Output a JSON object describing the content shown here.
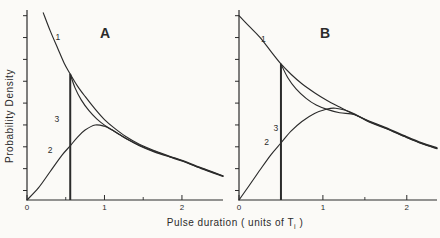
{
  "figure": {
    "xlabel_before": "Pulse duration ( units of T",
    "xlabel_sub": "i",
    "xlabel_after": " )",
    "ylabel": "Probability Density",
    "ink_color": "#2b2b2b",
    "paper_color": "#fbfaf7"
  },
  "chart_data": {
    "type": "line",
    "xlabel": "Pulse duration ( units of Ti )",
    "ylabel": "Probability Density",
    "legend": "none",
    "grid": false,
    "panels": [
      {
        "label": "A",
        "xlim": [
          0,
          2.53
        ],
        "ylim_norm": [
          0,
          1
        ],
        "x_major_ticks": [
          {
            "v": 0,
            "label": "0"
          },
          {
            "v": 1,
            "label": "1"
          },
          {
            "v": 2,
            "label": "2"
          }
        ],
        "x_minor_ticks": [
          0.5,
          1.5
        ],
        "y_ticks_norm": [
          0.05,
          0.165,
          0.28,
          0.395,
          0.51,
          0.625,
          0.74,
          0.855,
          0.97
        ],
        "curves": [
          {
            "name": "1",
            "label_at": [
              0.4,
              0.84
            ],
            "points": [
              [
                0.21,
                0.985
              ],
              [
                0.3,
                0.89
              ],
              [
                0.4,
                0.795
              ],
              [
                0.48,
                0.72
              ],
              [
                0.558,
                0.663
              ],
              [
                0.65,
                0.601
              ],
              [
                0.75,
                0.545
              ],
              [
                0.88,
                0.478
              ],
              [
                1.0,
                0.423
              ],
              [
                1.12,
                0.381
              ],
              [
                1.27,
                0.336
              ],
              [
                1.45,
                0.294
              ],
              [
                1.65,
                0.259
              ],
              [
                1.85,
                0.229
              ],
              [
                2.0,
                0.209
              ],
              [
                2.25,
                0.169
              ],
              [
                2.53,
                0.128
              ]
            ]
          },
          {
            "name": "2",
            "label_at": [
              0.3,
              0.25
            ],
            "points": [
              [
                0,
                0
              ],
              [
                0.15,
                0.065
              ],
              [
                0.3,
                0.15
              ],
              [
                0.45,
                0.235
              ],
              [
                0.558,
                0.285
              ],
              [
                0.65,
                0.33
              ],
              [
                0.75,
                0.368
              ],
              [
                0.88,
                0.395
              ],
              [
                1.0,
                0.388
              ],
              [
                1.1,
                0.368
              ],
              [
                1.2,
                0.343
              ],
              [
                1.3,
                0.318
              ],
              [
                1.45,
                0.288
              ],
              [
                1.65,
                0.255
              ],
              [
                1.85,
                0.227
              ],
              [
                2.0,
                0.207
              ],
              [
                2.25,
                0.167
              ],
              [
                2.53,
                0.126
              ]
            ]
          },
          {
            "name": "3",
            "label_at": [
              0.385,
              0.41
            ],
            "drop_line": {
              "x": 0.558,
              "top": 0.663
            },
            "points": [
              [
                0.558,
                0.663
              ],
              [
                0.62,
                0.59
              ],
              [
                0.7,
                0.527
              ],
              [
                0.8,
                0.47
              ],
              [
                0.9,
                0.427
              ],
              [
                1.0,
                0.394
              ],
              [
                1.12,
                0.363
              ],
              [
                1.27,
                0.326
              ],
              [
                1.45,
                0.286
              ],
              [
                1.65,
                0.252
              ],
              [
                1.85,
                0.225
              ],
              [
                2.0,
                0.205
              ],
              [
                2.25,
                0.165
              ],
              [
                2.53,
                0.124
              ]
            ]
          }
        ]
      },
      {
        "label": "B",
        "xlim": [
          0,
          2.36
        ],
        "ylim_norm": [
          0,
          1
        ],
        "x_major_ticks": [
          {
            "v": 0,
            "label": "0"
          },
          {
            "v": 1,
            "label": "1"
          },
          {
            "v": 2,
            "label": "2"
          }
        ],
        "x_minor_ticks": [
          0.5,
          1.5
        ],
        "y_ticks_norm": [
          0.05,
          0.165,
          0.28,
          0.395,
          0.51,
          0.625,
          0.74,
          0.855,
          0.97
        ],
        "curves": [
          {
            "name": "1",
            "label_at": [
              0.29,
              0.83
            ],
            "points": [
              [
                0,
                0.97
              ],
              [
                0.12,
                0.915
              ],
              [
                0.25,
                0.856
              ],
              [
                0.38,
                0.782
              ],
              [
                0.5,
                0.716
              ],
              [
                0.62,
                0.662
              ],
              [
                0.75,
                0.612
              ],
              [
                0.9,
                0.565
              ],
              [
                1.05,
                0.524
              ],
              [
                1.2,
                0.489
              ],
              [
                1.35,
                0.455
              ],
              [
                1.55,
                0.416
              ],
              [
                1.75,
                0.381
              ],
              [
                2.0,
                0.333
              ],
              [
                2.18,
                0.301
              ],
              [
                2.36,
                0.275
              ]
            ]
          },
          {
            "name": "2",
            "label_at": [
              0.33,
              0.29
            ],
            "points": [
              [
                0,
                0
              ],
              [
                0.12,
                0.075
              ],
              [
                0.25,
                0.158
              ],
              [
                0.38,
                0.238
              ],
              [
                0.5,
                0.3
              ],
              [
                0.62,
                0.362
              ],
              [
                0.75,
                0.413
              ],
              [
                0.9,
                0.455
              ],
              [
                1.05,
                0.479
              ],
              [
                1.15,
                0.483
              ],
              [
                1.27,
                0.472
              ],
              [
                1.38,
                0.452
              ],
              [
                1.55,
                0.413
              ],
              [
                1.75,
                0.378
              ],
              [
                2.0,
                0.33
              ],
              [
                2.18,
                0.298
              ],
              [
                2.36,
                0.272
              ]
            ]
          },
          {
            "name": "3",
            "label_at": [
              0.44,
              0.365
            ],
            "drop_line": {
              "x": 0.5,
              "top": 0.716
            },
            "points": [
              [
                0.5,
                0.716
              ],
              [
                0.58,
                0.645
              ],
              [
                0.68,
                0.585
              ],
              [
                0.8,
                0.535
              ],
              [
                0.92,
                0.5
              ],
              [
                1.05,
                0.477
              ],
              [
                1.2,
                0.459
              ],
              [
                1.38,
                0.449
              ],
              [
                1.55,
                0.411
              ],
              [
                1.75,
                0.376
              ],
              [
                2.0,
                0.328
              ],
              [
                2.18,
                0.296
              ],
              [
                2.36,
                0.27
              ]
            ]
          }
        ]
      }
    ]
  }
}
